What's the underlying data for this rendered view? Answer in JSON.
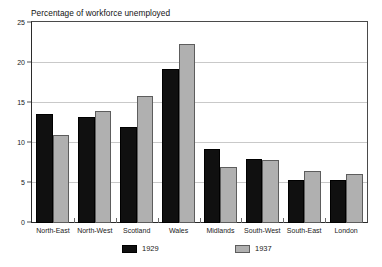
{
  "chart_data": {
    "type": "bar",
    "title": "Percentage of workforce unemployed",
    "xlabel": "",
    "ylabel": "",
    "ylim": [
      0,
      25
    ],
    "yticks": [
      0,
      5,
      10,
      15,
      20,
      25
    ],
    "grid": true,
    "legend_position": "bottom",
    "categories": [
      "North-East",
      "North-West",
      "Scotland",
      "Wales",
      "Midlands",
      "South-West",
      "South-East",
      "London"
    ],
    "series": [
      {
        "name": "1929",
        "color": "#101010",
        "values": [
          13.6,
          13.2,
          12.0,
          19.2,
          9.2,
          7.9,
          5.4,
          5.4
        ]
      },
      {
        "name": "1937",
        "color": "#b0b0b0",
        "values": [
          11.0,
          13.9,
          15.8,
          22.3,
          7.0,
          7.8,
          6.5,
          6.1
        ]
      }
    ]
  },
  "colors": {
    "series_1929": "#101010",
    "series_1937": "#b0b0b0",
    "gridline": "#c9c9c9",
    "axis": "#2b2b2b",
    "background": "#ffffff"
  }
}
